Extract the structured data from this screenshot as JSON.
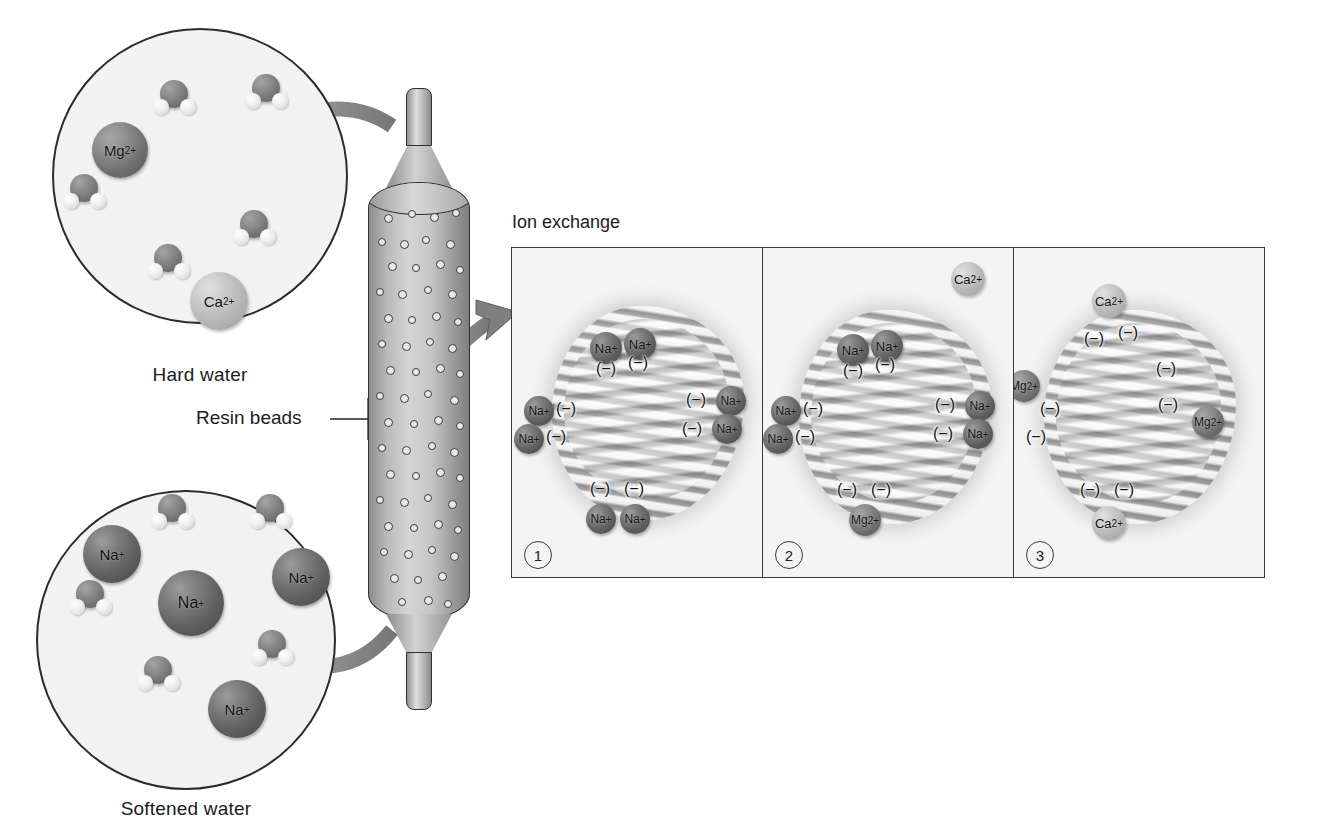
{
  "diagram": {
    "labels": {
      "hard_water": "Hard water",
      "softened_water": "Softened water",
      "resin_beads": "Resin beads",
      "ion_exchange": "Ion exchange"
    },
    "colors": {
      "sodium_sphere": "#5e5e5e",
      "magnesium_sphere": "#6d6d6d",
      "calcium_sphere": "#b0b0b0",
      "outline": "#2b2b2b",
      "panel_background": "#f4f4f4",
      "arrow_gray": "#8a8a8a",
      "tank_body": "#c6c6c6"
    }
  },
  "hard_water_circle": {
    "caption": "Hard water",
    "ions": [
      {
        "label": "Mg",
        "charge": "2+",
        "type": "magnesium",
        "x": 92,
        "y": 122,
        "size": 56
      },
      {
        "label": "Ca",
        "charge": "2+",
        "type": "calcium",
        "x": 190,
        "y": 272,
        "size": 58
      }
    ],
    "water_molecules": 5
  },
  "softened_water_circle": {
    "caption": "Softened water",
    "ions": [
      {
        "label": "Na",
        "charge": "+",
        "type": "sodium",
        "x": 83,
        "y": 525,
        "size": 58
      },
      {
        "label": "Na",
        "charge": "+",
        "type": "sodium",
        "x": 158,
        "y": 570,
        "size": 66
      },
      {
        "label": "Na",
        "charge": "+",
        "type": "sodium",
        "x": 272,
        "y": 548,
        "size": 58
      },
      {
        "label": "Na",
        "charge": "+",
        "type": "sodium",
        "x": 208,
        "y": 680,
        "size": 58
      }
    ],
    "water_molecules": 5
  },
  "tank": {
    "label": "Resin beads",
    "bead_count": 62,
    "inlet": "top",
    "outlet": "bottom"
  },
  "ion_exchange": {
    "title": "Ion exchange",
    "steps": [
      {
        "number": "1",
        "badge": "1",
        "caption": "Resin beads loaded with sodium ions",
        "bound_ions": [
          {
            "label": "Na",
            "charge": "+",
            "type": "sodium"
          },
          {
            "label": "Na",
            "charge": "+",
            "type": "sodium"
          },
          {
            "label": "Na",
            "charge": "+",
            "type": "sodium"
          },
          {
            "label": "Na",
            "charge": "+",
            "type": "sodium"
          },
          {
            "label": "Na",
            "charge": "+",
            "type": "sodium"
          },
          {
            "label": "Na",
            "charge": "+",
            "type": "sodium"
          },
          {
            "label": "Na",
            "charge": "+",
            "type": "sodium"
          },
          {
            "label": "Na",
            "charge": "+",
            "type": "sodium"
          }
        ],
        "negative_sites": 8,
        "site_symbol": "(−)",
        "incoming_ion": null
      },
      {
        "number": "2",
        "badge": "2",
        "caption": "Calcium ion approaches, magnesium already exchanged",
        "bound_ions": [
          {
            "label": "Na",
            "charge": "+",
            "type": "sodium"
          },
          {
            "label": "Na",
            "charge": "+",
            "type": "sodium"
          },
          {
            "label": "Na",
            "charge": "+",
            "type": "sodium"
          },
          {
            "label": "Na",
            "charge": "+",
            "type": "sodium"
          },
          {
            "label": "Na",
            "charge": "+",
            "type": "sodium"
          },
          {
            "label": "Na",
            "charge": "+",
            "type": "sodium"
          },
          {
            "label": "Mg",
            "charge": "2+",
            "type": "magnesium"
          }
        ],
        "negative_sites": 8,
        "site_symbol": "(−)",
        "incoming_ion": {
          "label": "Ca",
          "charge": "2+",
          "type": "calcium"
        }
      },
      {
        "number": "3",
        "badge": "3",
        "caption": "Resin beads now hold calcium and magnesium ions",
        "bound_ions": [
          {
            "label": "Ca",
            "charge": "2+",
            "type": "calcium"
          },
          {
            "label": "Mg",
            "charge": "2+",
            "type": "magnesium"
          },
          {
            "label": "Mg",
            "charge": "2+",
            "type": "magnesium"
          },
          {
            "label": "Ca",
            "charge": "2+",
            "type": "calcium"
          }
        ],
        "negative_sites": 8,
        "site_symbol": "(−)",
        "incoming_ion": null
      }
    ]
  }
}
